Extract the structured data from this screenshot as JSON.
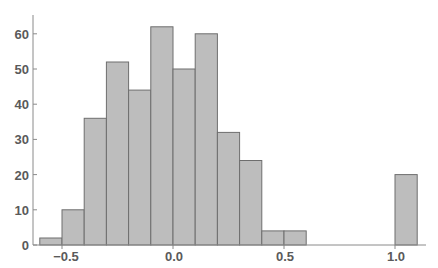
{
  "chart_data": {
    "type": "bar",
    "subtype": "histogram",
    "title": "",
    "xlabel": "",
    "ylabel": "",
    "bin_width": 0.1,
    "bins": [
      {
        "x0": -0.6,
        "x1": -0.5,
        "count": 2
      },
      {
        "x0": -0.5,
        "x1": -0.4,
        "count": 10
      },
      {
        "x0": -0.4,
        "x1": -0.3,
        "count": 36
      },
      {
        "x0": -0.3,
        "x1": -0.2,
        "count": 52
      },
      {
        "x0": -0.2,
        "x1": -0.1,
        "count": 44
      },
      {
        "x0": -0.1,
        "x1": 0.0,
        "count": 62
      },
      {
        "x0": 0.0,
        "x1": 0.1,
        "count": 50
      },
      {
        "x0": 0.1,
        "x1": 0.2,
        "count": 60
      },
      {
        "x0": 0.2,
        "x1": 0.3,
        "count": 32
      },
      {
        "x0": 0.3,
        "x1": 0.4,
        "count": 24
      },
      {
        "x0": 0.4,
        "x1": 0.5,
        "count": 4
      },
      {
        "x0": 0.5,
        "x1": 0.6,
        "count": 4
      },
      {
        "x0": 1.0,
        "x1": 1.1,
        "count": 20
      }
    ],
    "categories": [
      "-0.6–-0.5",
      "-0.5–-0.4",
      "-0.4–-0.3",
      "-0.3–-0.2",
      "-0.2–-0.1",
      "-0.1–0.0",
      "0.0–0.1",
      "0.1–0.2",
      "0.2–0.3",
      "0.3–0.4",
      "0.4–0.5",
      "0.5–0.6",
      "1.0–1.1"
    ],
    "values": [
      2,
      10,
      36,
      52,
      44,
      62,
      50,
      60,
      32,
      24,
      4,
      4,
      20
    ],
    "x_ticks": [
      {
        "value": -0.5,
        "label": "-0.5"
      },
      {
        "value": 0.0,
        "label": "0.0"
      },
      {
        "value": 0.5,
        "label": "0.5"
      },
      {
        "value": 1.0,
        "label": "1.0"
      }
    ],
    "y_ticks": [
      {
        "value": 0,
        "label": "0"
      },
      {
        "value": 10,
        "label": "10"
      },
      {
        "value": 20,
        "label": "20"
      },
      {
        "value": 30,
        "label": "30"
      },
      {
        "value": 40,
        "label": "40"
      },
      {
        "value": 50,
        "label": "50"
      },
      {
        "value": 60,
        "label": "60"
      }
    ],
    "xlim": [
      -0.63,
      1.13
    ],
    "ylim": [
      0,
      65
    ],
    "grid": false,
    "legend": null,
    "colors": {
      "bar_fill": "#bdbdbd",
      "bar_edge": "#6e6e6e",
      "axis": "#8a8a8a",
      "text": "#5a5a5a"
    }
  }
}
